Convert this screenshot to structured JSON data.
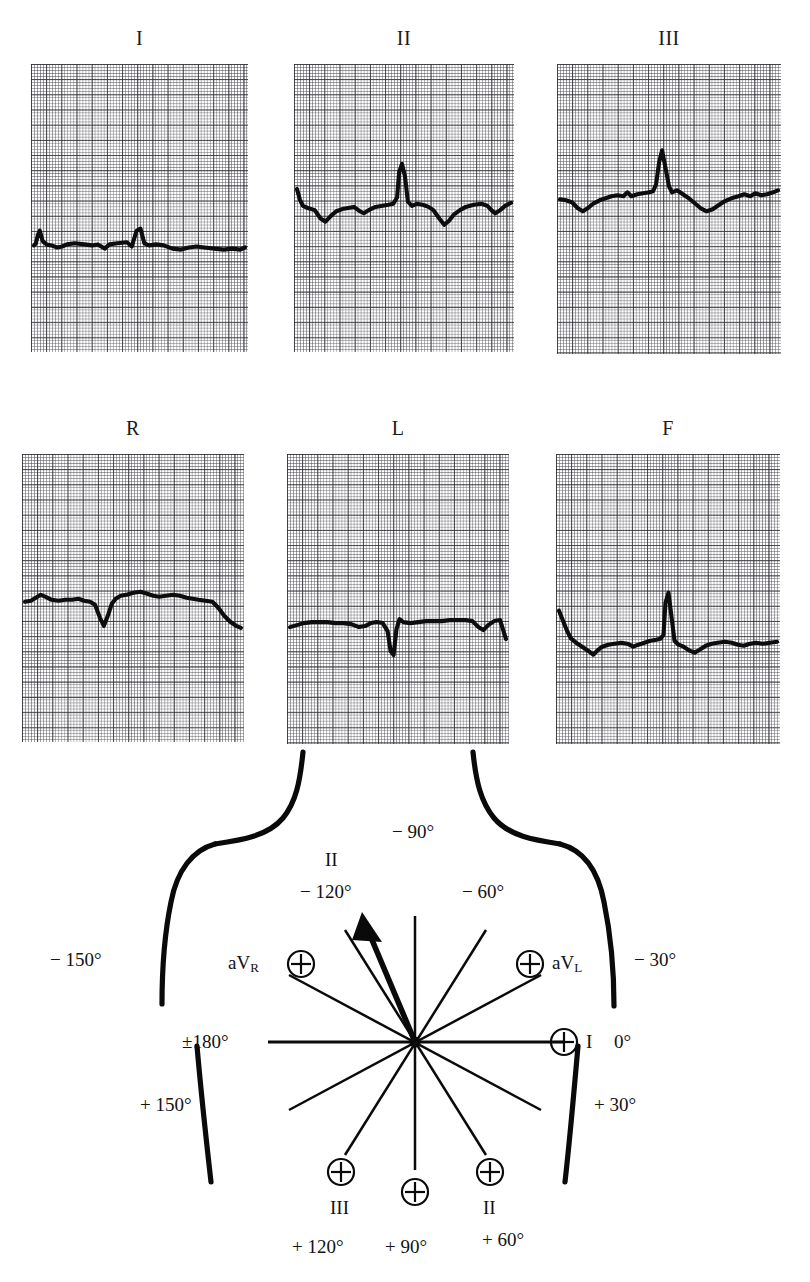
{
  "figure": {
    "kind": "ecg-limb-leads-with-hexaxial-reference",
    "ecg_rows": [
      {
        "row_name": "standard-bipolar-limb-leads",
        "panels": [
          {
            "label": "I",
            "name": "lead-1"
          },
          {
            "label": "II",
            "name": "lead-2"
          },
          {
            "label": "III",
            "name": "lead-3"
          }
        ]
      },
      {
        "row_name": "augmented-unipolar-limb-leads",
        "panels": [
          {
            "label": "R",
            "name": "lead-avr"
          },
          {
            "label": "L",
            "name": "lead-avl"
          },
          {
            "label": "F",
            "name": "lead-avf"
          }
        ]
      }
    ],
    "hexaxial": {
      "title": "hexaxial-reference-system",
      "center_label": "origin",
      "degree_labels": [
        {
          "key": "minus-90",
          "text": "− 90°"
        },
        {
          "key": "minus-120",
          "text": "− 120°"
        },
        {
          "key": "minus-60",
          "text": "− 60°"
        },
        {
          "key": "minus-150",
          "text": "− 150°"
        },
        {
          "key": "minus-30",
          "text": "− 30°"
        },
        {
          "key": "plus-minus-180",
          "text": "±180°"
        },
        {
          "key": "zero",
          "text": "0°"
        },
        {
          "key": "plus-150",
          "text": "+ 150°"
        },
        {
          "key": "plus-30",
          "text": "+ 30°"
        },
        {
          "key": "plus-120",
          "text": "+ 120°"
        },
        {
          "key": "plus-90",
          "text": "+ 90°"
        },
        {
          "key": "plus-60",
          "text": "+ 60°"
        }
      ],
      "lead_labels": [
        {
          "key": "lead-2-negative",
          "text": "II"
        },
        {
          "key": "avr",
          "text": "aVR",
          "base": "aV",
          "sub": "R"
        },
        {
          "key": "avl",
          "text": "aVL",
          "base": "aV",
          "sub": "L"
        },
        {
          "key": "lead-1",
          "text": "I"
        },
        {
          "key": "lead-3-positive",
          "text": "III"
        },
        {
          "key": "lead-2-positive",
          "text": "II"
        }
      ],
      "positive_pole_symbol": "⊕",
      "mean_axis_arrow_degrees": -105
    },
    "chart_data": {
      "type": "line",
      "title": "Six limb lead electrocardiogram tracings",
      "xlabel": "time (ECG paper, 1 mm small square)",
      "ylabel": "voltage (ECG paper, 1 mm small square)",
      "grid": "ecg-paper-1mm-small-5mm-bold",
      "series": [
        {
          "name": "I",
          "points": [
            [
              0,
              0
            ],
            [
              2,
              2
            ],
            [
              4,
              10
            ],
            [
              6,
              14
            ],
            [
              9,
              4
            ],
            [
              13,
              1
            ],
            [
              18,
              0
            ],
            [
              24,
              -2
            ],
            [
              29,
              -1
            ],
            [
              34,
              1
            ],
            [
              42,
              2
            ],
            [
              52,
              1
            ],
            [
              60,
              0
            ],
            [
              66,
              1
            ],
            [
              73,
              -3
            ],
            [
              78,
              1
            ],
            [
              86,
              2
            ],
            [
              96,
              3
            ],
            [
              101,
              -1
            ],
            [
              106,
              14
            ],
            [
              110,
              16
            ],
            [
              114,
              2
            ],
            [
              119,
              0
            ],
            [
              126,
              1
            ],
            [
              134,
              0
            ],
            [
              143,
              -3
            ],
            [
              152,
              -4
            ],
            [
              160,
              -2
            ],
            [
              168,
              -1
            ],
            [
              176,
              -2
            ],
            [
              186,
              -3
            ],
            [
              196,
              -4
            ],
            [
              205,
              -3
            ],
            [
              213,
              -4
            ],
            [
              218,
              -2
            ]
          ]
        },
        {
          "name": "II",
          "points": [
            [
              0,
              18
            ],
            [
              3,
              8
            ],
            [
              6,
              2
            ],
            [
              11,
              0
            ],
            [
              18,
              -2
            ],
            [
              24,
              -10
            ],
            [
              29,
              -13
            ],
            [
              34,
              -8
            ],
            [
              40,
              -3
            ],
            [
              46,
              -1
            ],
            [
              52,
              0
            ],
            [
              58,
              1
            ],
            [
              64,
              -3
            ],
            [
              68,
              -5
            ],
            [
              73,
              -2
            ],
            [
              80,
              1
            ],
            [
              86,
              2
            ],
            [
              93,
              3
            ],
            [
              98,
              4
            ],
            [
              102,
              10
            ],
            [
              104,
              34
            ],
            [
              107,
              42
            ],
            [
              110,
              30
            ],
            [
              113,
              6
            ],
            [
              117,
              2
            ],
            [
              122,
              4
            ],
            [
              128,
              3
            ],
            [
              134,
              1
            ],
            [
              139,
              -2
            ],
            [
              145,
              -10
            ],
            [
              150,
              -16
            ],
            [
              155,
              -12
            ],
            [
              160,
              -6
            ],
            [
              166,
              -2
            ],
            [
              172,
              1
            ],
            [
              180,
              3
            ],
            [
              188,
              4
            ],
            [
              194,
              2
            ],
            [
              198,
              -2
            ],
            [
              202,
              -5
            ],
            [
              207,
              -2
            ],
            [
              212,
              2
            ],
            [
              218,
              5
            ]
          ]
        },
        {
          "name": "III",
          "points": [
            [
              0,
              1
            ],
            [
              6,
              0
            ],
            [
              12,
              -2
            ],
            [
              18,
              -8
            ],
            [
              23,
              -11
            ],
            [
              28,
              -8
            ],
            [
              34,
              -3
            ],
            [
              40,
              0
            ],
            [
              46,
              2
            ],
            [
              52,
              4
            ],
            [
              58,
              5
            ],
            [
              64,
              4
            ],
            [
              68,
              8
            ],
            [
              72,
              4
            ],
            [
              78,
              6
            ],
            [
              84,
              7
            ],
            [
              90,
              8
            ],
            [
              94,
              9
            ],
            [
              97,
              16
            ],
            [
              100,
              38
            ],
            [
              103,
              50
            ],
            [
              107,
              30
            ],
            [
              110,
              14
            ],
            [
              113,
              8
            ],
            [
              118,
              10
            ],
            [
              124,
              6
            ],
            [
              130,
              2
            ],
            [
              136,
              -3
            ],
            [
              142,
              -8
            ],
            [
              148,
              -11
            ],
            [
              154,
              -9
            ],
            [
              160,
              -5
            ],
            [
              166,
              -1
            ],
            [
              173,
              2
            ],
            [
              180,
              4
            ],
            [
              186,
              6
            ],
            [
              192,
              4
            ],
            [
              197,
              7
            ],
            [
              203,
              5
            ],
            [
              209,
              6
            ],
            [
              215,
              8
            ],
            [
              220,
              10
            ]
          ]
        },
        {
          "name": "R",
          "points": [
            [
              0,
              2
            ],
            [
              6,
              3
            ],
            [
              11,
              6
            ],
            [
              16,
              9
            ],
            [
              21,
              7
            ],
            [
              27,
              4
            ],
            [
              34,
              3
            ],
            [
              41,
              4
            ],
            [
              48,
              4
            ],
            [
              54,
              5
            ],
            [
              60,
              3
            ],
            [
              66,
              2
            ],
            [
              71,
              -1
            ],
            [
              76,
              -14
            ],
            [
              80,
              -22
            ],
            [
              84,
              -12
            ],
            [
              88,
              0
            ],
            [
              92,
              5
            ],
            [
              97,
              8
            ],
            [
              103,
              9
            ],
            [
              110,
              11
            ],
            [
              117,
              12
            ],
            [
              124,
              10
            ],
            [
              130,
              8
            ],
            [
              136,
              7
            ],
            [
              143,
              8
            ],
            [
              150,
              9
            ],
            [
              157,
              8
            ],
            [
              164,
              6
            ],
            [
              170,
              5
            ],
            [
              176,
              4
            ],
            [
              183,
              3
            ],
            [
              190,
              2
            ],
            [
              196,
              -4
            ],
            [
              202,
              -12
            ],
            [
              208,
              -18
            ],
            [
              214,
              -22
            ],
            [
              219,
              -24
            ]
          ]
        },
        {
          "name": "L",
          "points": [
            [
              0,
              -2
            ],
            [
              7,
              0
            ],
            [
              14,
              2
            ],
            [
              22,
              3
            ],
            [
              30,
              3
            ],
            [
              38,
              3
            ],
            [
              46,
              2
            ],
            [
              54,
              2
            ],
            [
              62,
              1
            ],
            [
              70,
              -2
            ],
            [
              76,
              -1
            ],
            [
              82,
              2
            ],
            [
              88,
              3
            ],
            [
              94,
              2
            ],
            [
              99,
              -6
            ],
            [
              102,
              -26
            ],
            [
              105,
              -30
            ],
            [
              108,
              -4
            ],
            [
              111,
              6
            ],
            [
              115,
              3
            ],
            [
              122,
              2
            ],
            [
              130,
              3
            ],
            [
              138,
              4
            ],
            [
              146,
              4
            ],
            [
              154,
              4
            ],
            [
              162,
              5
            ],
            [
              170,
              5
            ],
            [
              178,
              5
            ],
            [
              185,
              4
            ],
            [
              191,
              -2
            ],
            [
              196,
              -5
            ],
            [
              201,
              0
            ],
            [
              207,
              4
            ],
            [
              213,
              5
            ],
            [
              219,
              -14
            ]
          ]
        },
        {
          "name": "F",
          "points": [
            [
              0,
              26
            ],
            [
              4,
              16
            ],
            [
              8,
              6
            ],
            [
              12,
              -2
            ],
            [
              17,
              -6
            ],
            [
              23,
              -10
            ],
            [
              29,
              -14
            ],
            [
              34,
              -18
            ],
            [
              38,
              -14
            ],
            [
              43,
              -10
            ],
            [
              49,
              -8
            ],
            [
              55,
              -7
            ],
            [
              62,
              -6
            ],
            [
              68,
              -7
            ],
            [
              74,
              -10
            ],
            [
              79,
              -8
            ],
            [
              85,
              -6
            ],
            [
              91,
              -4
            ],
            [
              97,
              -3
            ],
            [
              101,
              -2
            ],
            [
              104,
              2
            ],
            [
              106,
              34
            ],
            [
              109,
              44
            ],
            [
              112,
              20
            ],
            [
              115,
              -4
            ],
            [
              119,
              -8
            ],
            [
              124,
              -10
            ],
            [
              130,
              -14
            ],
            [
              135,
              -16
            ],
            [
              140,
              -13
            ],
            [
              146,
              -9
            ],
            [
              152,
              -7
            ],
            [
              158,
              -6
            ],
            [
              165,
              -5
            ],
            [
              172,
              -6
            ],
            [
              178,
              -8
            ],
            [
              184,
              -9
            ],
            [
              190,
              -7
            ],
            [
              196,
              -6
            ],
            [
              203,
              -7
            ],
            [
              210,
              -6
            ],
            [
              217,
              -5
            ]
          ]
        }
      ]
    }
  }
}
